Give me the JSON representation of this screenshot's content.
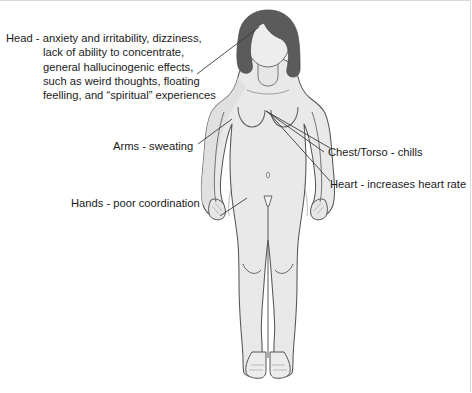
{
  "diagram": {
    "colors": {
      "body_fill": "#e9e9e9",
      "body_shade": "#dcdcdc",
      "outline": "#4a4a4a",
      "hair": "#585858",
      "text": "#1a1a1a",
      "leader_line": "#3a3a3a",
      "background": "#ffffff",
      "border": "#d8d8d8"
    },
    "callouts": [
      {
        "id": "head",
        "region": "Head",
        "lines": [
          "Head - anxiety and irritability, dizziness,",
          "lack of ability to concentrate,",
          "general hallucinogenic effects,",
          "such as weird thoughts, floating",
          "feelling, and “spiritual” experiences"
        ],
        "text": "Head - anxiety and irritability, dizziness, lack of ability to concentrate, general hallucinogenic effects, such as weird thoughts, floating feelling, and “spiritual” experiences"
      },
      {
        "id": "arms",
        "region": "Arms",
        "text": "Arms - sweating"
      },
      {
        "id": "chest",
        "region": "Chest/Torso",
        "text": "Chest/Torso - chills"
      },
      {
        "id": "heart",
        "region": "Heart",
        "text": "Heart - increases heart rate"
      },
      {
        "id": "hands",
        "region": "Hands",
        "text": "Hands - poor coordination"
      }
    ]
  }
}
